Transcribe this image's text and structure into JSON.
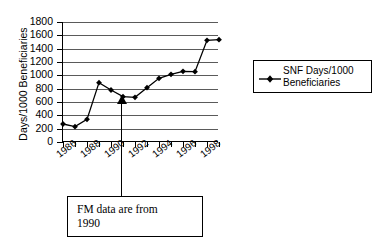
{
  "chart_data": {
    "type": "line",
    "title": "",
    "xlabel": "",
    "ylabel": "Days/1000 Beneficiaries",
    "ylim": [
      0,
      1800
    ],
    "ytick_step": 200,
    "yticks": [
      0,
      200,
      400,
      600,
      800,
      1000,
      1200,
      1400,
      1600,
      1800
    ],
    "xlim": [
      1986,
      1999
    ],
    "xticks": [
      1986,
      1987,
      1988,
      1989,
      1990,
      1991,
      1992,
      1993,
      1994,
      1995,
      1996,
      1997,
      1998,
      1999
    ],
    "xtick_labels": [
      "1986",
      "",
      "1988",
      "",
      "1990",
      "",
      "1992",
      "",
      "1994",
      "",
      "1996",
      "",
      "1998",
      ""
    ],
    "xtick_labels_shown": [
      "1986",
      "1988",
      "1990",
      "1992",
      "1994",
      "1996",
      "1998"
    ],
    "grid": true,
    "grid_axis": "y",
    "legend_position": "right",
    "marker": "diamond",
    "series": [
      {
        "name": "SNF Days/1000 Beneficiaries",
        "x": [
          1986,
          1987,
          1988,
          1989,
          1990,
          1991,
          1992,
          1993,
          1994,
          1995,
          1996,
          1997,
          1998,
          1999
        ],
        "values": [
          270,
          230,
          340,
          890,
          780,
          680,
          670,
          815,
          955,
          1015,
          1060,
          1055,
          1525,
          1535
        ],
        "color": "#000000"
      }
    ],
    "annotations": [
      {
        "text_lines": [
          "FM data are from",
          "1990"
        ],
        "text": "FM data are from 1990",
        "points_to_x": 1991,
        "points_to_y": 680
      }
    ]
  },
  "legend": {
    "entries": [
      {
        "label_line1": "SNF Days/1000",
        "label_line2": "Beneficiaries",
        "marker": "diamond-marker"
      }
    ]
  },
  "axis": {
    "y_title": "Days/1000 Beneficiaries",
    "y_labels": [
      "1800",
      "1600",
      "1400",
      "1200",
      "1000",
      "800",
      "600",
      "400",
      "200",
      "0"
    ],
    "x_labels": [
      "1986",
      "1988",
      "1990",
      "1992",
      "1994",
      "1996",
      "1998"
    ]
  },
  "annotation": {
    "line1": "FM data are from",
    "line2": "1990"
  },
  "colors": {
    "series": "#000000",
    "grid": "#5a5a5a",
    "axis": "#000000",
    "background": "#ffffff"
  }
}
